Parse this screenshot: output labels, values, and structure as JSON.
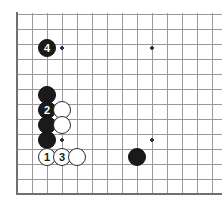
{
  "figure": {
    "kind": "go-board-diagram",
    "board": {
      "background_color": "#ffffff",
      "grid_color": "#9a9a9a",
      "border_color": "#6f6f6f",
      "line_width": 1,
      "border_width": 2,
      "cell_size": 15,
      "origin_x": 17,
      "origin_y": 14,
      "columns": 14,
      "rows": 12,
      "edges": {
        "left": "thick",
        "bottom": "thick",
        "top": "open",
        "right": "open"
      }
    },
    "star_points": [
      {
        "name": "star-point-upper-left",
        "col": 3,
        "row": 2,
        "x": 62,
        "y": 48
      },
      {
        "name": "star-point-upper-right",
        "col": 9,
        "row": 2,
        "x": 152,
        "y": 48
      },
      {
        "name": "star-point-lower-left",
        "col": 3,
        "row": 8,
        "x": 62,
        "y": 140
      },
      {
        "name": "star-point-lower-right",
        "col": 9,
        "row": 8,
        "x": 152,
        "y": 140
      }
    ],
    "stones": [
      {
        "id": "stone-black-4",
        "color": "black",
        "label": "4",
        "col": 2,
        "row": 2,
        "x": 47,
        "y": 48,
        "radius": 9
      },
      {
        "id": "stone-black-wall-top",
        "color": "black",
        "label": "",
        "col": 2,
        "row": 5,
        "x": 47,
        "y": 95,
        "radius": 9
      },
      {
        "id": "stone-black-2",
        "color": "black",
        "label": "2",
        "col": 2,
        "row": 6,
        "x": 47,
        "y": 110,
        "radius": 9
      },
      {
        "id": "stone-white-upper",
        "color": "white",
        "label": "",
        "col": 3,
        "row": 6,
        "x": 62,
        "y": 110,
        "radius": 9
      },
      {
        "id": "stone-black-wall-mid",
        "color": "black",
        "label": "",
        "col": 2,
        "row": 7,
        "x": 47,
        "y": 125,
        "radius": 9
      },
      {
        "id": "stone-white-mid",
        "color": "white",
        "label": "",
        "col": 3,
        "row": 7,
        "x": 62,
        "y": 125,
        "radius": 9
      },
      {
        "id": "stone-black-wall-low",
        "color": "black",
        "label": "",
        "col": 2,
        "row": 8,
        "x": 47,
        "y": 140,
        "radius": 9
      },
      {
        "id": "stone-white-1",
        "color": "white",
        "label": "1",
        "col": 2,
        "row": 9,
        "x": 47,
        "y": 157,
        "radius": 9
      },
      {
        "id": "stone-white-3",
        "color": "white",
        "label": "3",
        "col": 3,
        "row": 9,
        "x": 62,
        "y": 157,
        "radius": 9
      },
      {
        "id": "stone-white-right",
        "color": "white",
        "label": "",
        "col": 4,
        "row": 9,
        "x": 77,
        "y": 157,
        "radius": 9
      },
      {
        "id": "stone-black-lower-right",
        "color": "black",
        "label": "",
        "col": 8,
        "row": 9,
        "x": 137,
        "y": 157,
        "radius": 9
      }
    ],
    "move_sequence": [
      {
        "number": "1",
        "color": "white"
      },
      {
        "number": "2",
        "color": "black"
      },
      {
        "number": "3",
        "color": "white"
      },
      {
        "number": "4",
        "color": "black"
      }
    ]
  }
}
